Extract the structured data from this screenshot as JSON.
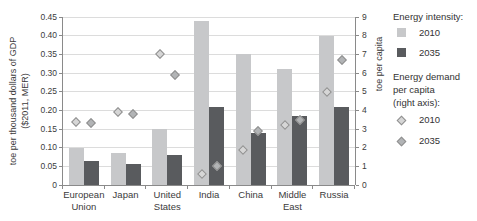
{
  "chart_data": {
    "type": "bar",
    "categories": [
      "European Union",
      "Japan",
      "United States",
      "India",
      "China",
      "Middle East",
      "Russia"
    ],
    "category_display": [
      "European\nUnion",
      "Japan",
      "United\nStates",
      "India",
      "China",
      "Middle\nEast",
      "Russia"
    ],
    "left_axis": {
      "label_line1": "toe per thousand dollars of GDP",
      "label_line2": "($2011, MER)",
      "ticks": [
        "0",
        "0.05",
        "0.10",
        "0.15",
        "0.20",
        "0.25",
        "0.30",
        "0.35",
        "0.40",
        "0.45"
      ],
      "range": [
        0,
        0.45
      ],
      "grid": true
    },
    "right_axis": {
      "label": "toe per capita",
      "ticks": [
        "0",
        "1",
        "2",
        "3",
        "4",
        "5",
        "6",
        "7",
        "8",
        "9"
      ],
      "range": [
        0,
        9
      ]
    },
    "series": [
      {
        "key": "intensity_2010",
        "name": "Energy intensity 2010",
        "type": "bar",
        "axis": "left",
        "color": "#c7c8ca",
        "values": [
          0.1,
          0.085,
          0.15,
          0.44,
          0.35,
          0.31,
          0.4
        ]
      },
      {
        "key": "intensity_2035",
        "name": "Energy intensity 2035",
        "type": "bar",
        "axis": "left",
        "color": "#595b5e",
        "values": [
          0.065,
          0.055,
          0.08,
          0.21,
          0.14,
          0.185,
          0.21
        ]
      },
      {
        "key": "demand_2010",
        "name": "Energy demand per capita 2010",
        "type": "scatter",
        "axis": "right",
        "color": "#d6d6d6",
        "border": "#909090",
        "values": [
          3.4,
          3.9,
          7.0,
          0.6,
          1.9,
          3.2,
          5.0
        ]
      },
      {
        "key": "demand_2035",
        "name": "Energy demand per capita 2035",
        "type": "scatter",
        "axis": "right",
        "color": "#b2b4b6",
        "border": "#909090",
        "values": [
          3.3,
          3.8,
          5.9,
          1.0,
          2.9,
          3.5,
          6.7
        ]
      }
    ],
    "legend_position": "right"
  },
  "legend": {
    "intensity_heading": "Energy intensity:",
    "intensity_items": [
      {
        "label": "2010",
        "color": "#c7c8ca"
      },
      {
        "label": "2035",
        "color": "#595b5e"
      }
    ],
    "demand_heading_line1": "Energy demand",
    "demand_heading_line2": "per capita",
    "demand_heading_line3": "(right axis):",
    "demand_items": [
      {
        "label": "2010",
        "color": "#d6d6d6"
      },
      {
        "label": "2035",
        "color": "#b2b4b6"
      }
    ]
  }
}
